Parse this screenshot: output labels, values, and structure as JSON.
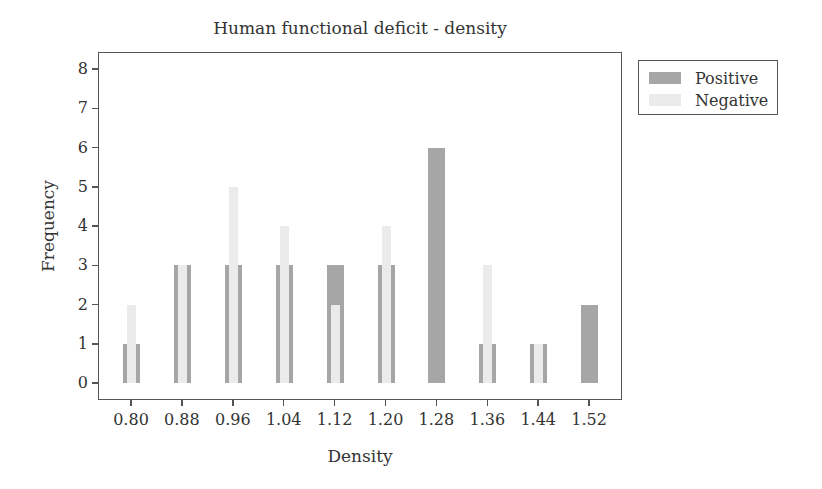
{
  "chart_data": {
    "type": "bar",
    "title": "Human functional deficit - density",
    "xlabel": "Density",
    "ylabel": "Frequency",
    "categories": [
      "0.80",
      "0.88",
      "0.96",
      "1.04",
      "1.12",
      "1.20",
      "1.28",
      "1.36",
      "1.44",
      "1.52"
    ],
    "series": [
      {
        "name": "Positive",
        "color": "#a6a6a6",
        "values": [
          1,
          3,
          3,
          3,
          3,
          3,
          6,
          1,
          1,
          2
        ]
      },
      {
        "name": "Negative",
        "color": "#ebebeb",
        "values": [
          2,
          3,
          5,
          4,
          2,
          4,
          0,
          3,
          1,
          0
        ]
      }
    ],
    "yticks": [
      "0",
      "1",
      "2",
      "3",
      "4",
      "5",
      "6",
      "7",
      "8"
    ],
    "ylim": [
      0,
      8
    ],
    "grid": false,
    "legend_position": "right-top-outside"
  }
}
